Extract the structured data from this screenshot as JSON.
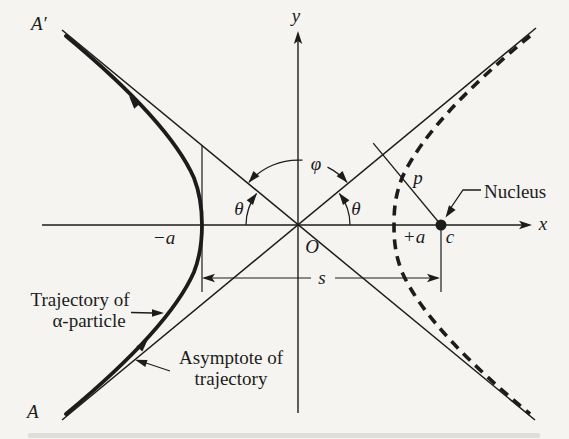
{
  "diagram": {
    "colors": {
      "ink": "#1c1c1c",
      "paper": "#f5f4f0"
    },
    "labels": {
      "A_prime": "A′",
      "A": "A",
      "y_axis": "y",
      "x_axis": "x",
      "origin": "O",
      "phi": "φ",
      "theta_left": "θ",
      "theta_right": "θ",
      "minus_a": "−a",
      "plus_a": "+a",
      "c": "c",
      "s": "s",
      "p": "p",
      "nucleus": "Nucleus",
      "trajectory_caption_line1": "Trajectory of",
      "trajectory_caption_line2": "α-particle",
      "asymptote_caption_line1": "Asymptote of",
      "asymptote_caption_line2": "trajectory"
    }
  }
}
